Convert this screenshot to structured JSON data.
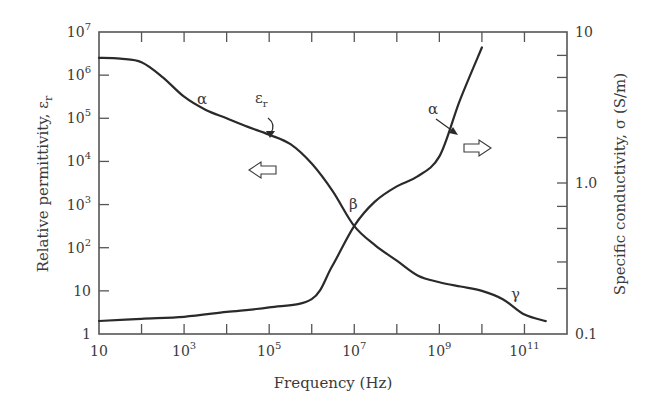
{
  "chart_data": {
    "type": "line",
    "title": "",
    "xlabel": "Frequency (Hz)",
    "ylabel": "Relative permittivity, εr",
    "ylabel_right": "Specific conductivity, σ (S/m)",
    "x_scale": "log",
    "y_scale": "log",
    "y_right_scale": "log",
    "xlim": [
      10,
      1000000000000.0
    ],
    "ylim": [
      1,
      10000000.0
    ],
    "ylim_right": [
      0.1,
      10
    ],
    "grid": false,
    "legend": null,
    "x_ticks": [
      {
        "value": 1,
        "label": "10",
        "exp": ""
      },
      {
        "value": 3,
        "label": "10",
        "exp": "3"
      },
      {
        "value": 5,
        "label": "10",
        "exp": "5"
      },
      {
        "value": 7,
        "label": "10",
        "exp": "7"
      },
      {
        "value": 9,
        "label": "10",
        "exp": "9"
      },
      {
        "value": 11,
        "label": "10",
        "exp": "11"
      }
    ],
    "x_minor_ticks": [
      2,
      4,
      6,
      8,
      10
    ],
    "y_ticks": [
      {
        "value": 0,
        "label": "1",
        "exp": ""
      },
      {
        "value": 1,
        "label": "10",
        "exp": ""
      },
      {
        "value": 2,
        "label": "10",
        "exp": "2"
      },
      {
        "value": 3,
        "label": "10",
        "exp": "3"
      },
      {
        "value": 4,
        "label": "10",
        "exp": "4"
      },
      {
        "value": 5,
        "label": "10",
        "exp": "5"
      },
      {
        "value": 6,
        "label": "10",
        "exp": "6"
      },
      {
        "value": 7,
        "label": "10",
        "exp": "7"
      }
    ],
    "y_right_ticks": [
      {
        "value": 0.1,
        "label": "0.1"
      },
      {
        "value": 1.0,
        "label": "1.0"
      },
      {
        "value": 10,
        "label": "10"
      }
    ],
    "y_right_minor_ticks": [
      0.2,
      0.3,
      0.5,
      0.7,
      2,
      3,
      5,
      7
    ],
    "series": [
      {
        "name": "Relative permittivity εr",
        "axis": "left",
        "x_log10": [
          1.0,
          1.5,
          2.0,
          2.5,
          3.0,
          3.5,
          4.0,
          4.5,
          5.0,
          5.5,
          6.0,
          6.5,
          7.0,
          7.5,
          8.0,
          8.5,
          9.0,
          9.5,
          10.0,
          10.5,
          11.0,
          11.5
        ],
        "y_log10": [
          6.4,
          6.38,
          6.3,
          5.95,
          5.5,
          5.2,
          5.0,
          4.8,
          4.62,
          4.4,
          3.95,
          3.3,
          2.5,
          2.05,
          1.7,
          1.35,
          1.2,
          1.1,
          1.0,
          0.8,
          0.45,
          0.3
        ]
      },
      {
        "name": "Specific conductivity σ",
        "axis": "right",
        "x": [
          10,
          100.0,
          1000.0,
          10000.0,
          100000.0,
          1000000.0,
          3000000.0,
          10000000.0,
          30000000.0,
          100000000.0,
          300000000.0,
          1000000000.0,
          3000000000.0,
          10000000000.0
        ],
        "y": [
          0.122,
          0.126,
          0.13,
          0.14,
          0.15,
          0.17,
          0.28,
          0.52,
          0.75,
          0.95,
          1.1,
          1.5,
          3.5,
          7.9
        ]
      }
    ],
    "annotations": [
      {
        "text": "α",
        "near": "permittivity α dispersion",
        "x_log10": 3.5,
        "y_log10": 5.6
      },
      {
        "text": "εr",
        "near": "permittivity curve label with curved arrow",
        "x_log10": 5.0,
        "y_log10": 5.2
      },
      {
        "text": "β",
        "near": "β dispersion",
        "x_log10": 7.0,
        "y_log10": 2.9
      },
      {
        "text": "γ",
        "near": "γ dispersion",
        "x_log10": 11.0,
        "y_log10": 0.9
      },
      {
        "text": "α",
        "near": "conductivity α label with arrow",
        "x_log10": 8.8,
        "y_right": 4.5
      },
      {
        "text": "⇦",
        "near": "arrow pointing to left axis"
      },
      {
        "text": "⇨",
        "near": "arrow pointing to right axis"
      }
    ]
  },
  "labels": {
    "xlabel": "Frequency (Hz)",
    "ylabel_main": "Relative permittivity, ε",
    "ylabel_sub": "r",
    "ylabel_right": "Specific conductivity, σ (S/m)",
    "alpha": "α",
    "beta": "β",
    "gamma": "γ",
    "eps": "ε",
    "eps_sub": "r",
    "alpha2": "α"
  },
  "colors": {
    "line": "#2a2a2a",
    "axis": "#555555",
    "text": "#3a3a3a"
  }
}
